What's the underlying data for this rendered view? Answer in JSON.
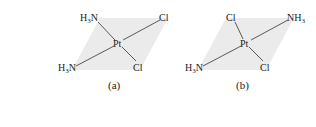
{
  "figure": {
    "panels": [
      {
        "caption": "(a)",
        "center": "Pt",
        "ligands": {
          "top_left": {
            "main": "H",
            "sub": "3",
            "tail": "N"
          },
          "top_right": "Cl",
          "bottom_left": {
            "main": "H",
            "sub": "3",
            "tail": "N"
          },
          "bottom_right": "Cl"
        }
      },
      {
        "caption": "(b)",
        "center": "Pt",
        "ligands": {
          "top_left": "Cl",
          "top_right": {
            "main": "NH",
            "sub": "3"
          },
          "bottom_left": {
            "main": "H",
            "sub": "3",
            "tail": "N"
          },
          "bottom_right": "Cl"
        }
      }
    ],
    "colors": {
      "plane": "#ebebeb",
      "bond": "#333333",
      "text": "#222222"
    }
  }
}
